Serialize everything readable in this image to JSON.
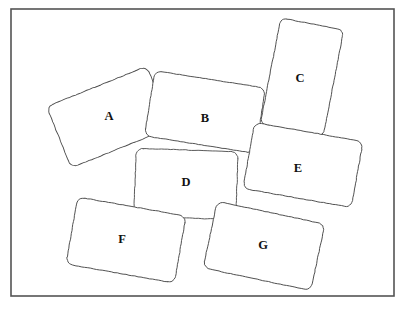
{
  "figure": {
    "background_color": "#ffffff",
    "frame": {
      "name": "outer-border",
      "x": 11,
      "y": 9,
      "width": 383,
      "height": 287,
      "stroke_color": "#545454",
      "stroke_width": 1.6
    },
    "shape_stroke_color": "#4a4a4a",
    "shape_fill_color": "#ffffff",
    "label_color": "#111111",
    "cards": [
      {
        "id": "card-a",
        "label": "A",
        "cx": 109,
        "cy": 117,
        "width": 108,
        "height": 66,
        "rotation": -22,
        "corner_radius": 7,
        "label_dx": 0,
        "label_dy": 0
      },
      {
        "id": "card-b",
        "label": "B",
        "cx": 205,
        "cy": 112,
        "width": 112,
        "height": 66,
        "rotation": 9,
        "corner_radius": 7,
        "label_dx": 0,
        "label_dy": 7
      },
      {
        "id": "card-c",
        "label": "C",
        "cx": 302,
        "cy": 77,
        "width": 64,
        "height": 108,
        "rotation": 11,
        "corner_radius": 6,
        "label_dx": -2,
        "label_dy": 2
      },
      {
        "id": "card-d",
        "label": "D",
        "cx": 186,
        "cy": 184,
        "width": 102,
        "height": 68,
        "rotation": 2,
        "corner_radius": 7,
        "label_dx": 0,
        "label_dy": -1
      },
      {
        "id": "card-e",
        "label": "E",
        "cx": 303,
        "cy": 165,
        "width": 110,
        "height": 67,
        "rotation": 10,
        "corner_radius": 7,
        "label_dx": -5,
        "label_dy": 4
      },
      {
        "id": "card-f",
        "label": "F",
        "cx": 126,
        "cy": 240,
        "width": 110,
        "height": 68,
        "rotation": 10,
        "corner_radius": 7,
        "label_dx": -4,
        "label_dy": 0
      },
      {
        "id": "card-g",
        "label": "G",
        "cx": 264,
        "cy": 246,
        "width": 110,
        "height": 68,
        "rotation": 12,
        "corner_radius": 7,
        "label_dx": -1,
        "label_dy": 0
      }
    ]
  }
}
